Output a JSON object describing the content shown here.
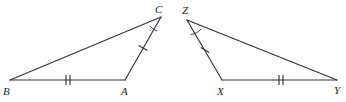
{
  "figure": {
    "background_color": "#ffffff",
    "stroke_color": "#32323c",
    "label_color": "#26262e",
    "width": 346,
    "height": 102,
    "triangles": [
      {
        "name": "triangle-abc",
        "vertices": [
          {
            "label": "B",
            "x": 10,
            "y": 80,
            "label_x": 3,
            "label_y": 95
          },
          {
            "label": "A",
            "x": 125,
            "y": 80,
            "label_x": 121,
            "label_y": 95
          },
          {
            "label": "C",
            "x": 161,
            "y": 17,
            "label_x": 155,
            "label_y": 13
          }
        ],
        "sides": [
          {
            "name": "side-BA",
            "from": "B",
            "to": "A",
            "ticks": 2,
            "tick_x": 68,
            "tick_y": 80
          },
          {
            "name": "side-AC",
            "from": "A",
            "to": "C",
            "ticks": 1,
            "tick_x": 143,
            "tick_y": 48
          },
          {
            "name": "side-CB",
            "from": "C",
            "to": "B",
            "ticks": 0
          }
        ],
        "angle_marks": [
          {
            "name": "angle-C",
            "at": "C",
            "arcs": 1
          }
        ]
      },
      {
        "name": "triangle-xyz",
        "vertices": [
          {
            "label": "Z",
            "x": 187,
            "y": 20,
            "label_x": 182,
            "label_y": 14
          },
          {
            "label": "X",
            "x": 222,
            "y": 80,
            "label_x": 217,
            "label_y": 95
          },
          {
            "label": "Y",
            "x": 337,
            "y": 80,
            "label_x": 334,
            "label_y": 94
          }
        ],
        "sides": [
          {
            "name": "side-XY",
            "from": "X",
            "to": "Y",
            "ticks": 2,
            "tick_x": 281,
            "tick_y": 80
          },
          {
            "name": "side-ZX",
            "from": "Z",
            "to": "X",
            "ticks": 1,
            "tick_x": 205,
            "tick_y": 50
          },
          {
            "name": "side-YZ",
            "from": "Y",
            "to": "Z",
            "ticks": 0
          }
        ],
        "angle_marks": [
          {
            "name": "angle-Z",
            "at": "Z",
            "arcs": 1
          }
        ]
      }
    ],
    "labels": {
      "b": "B",
      "a": "A",
      "c": "C",
      "z": "Z",
      "x": "X",
      "y": "Y"
    }
  }
}
